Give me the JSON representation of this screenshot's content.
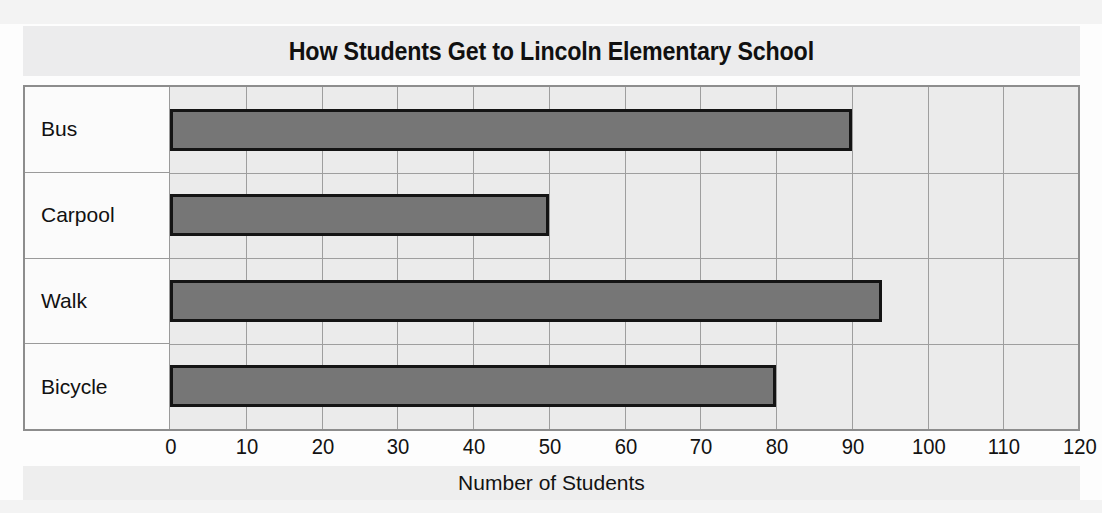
{
  "chart_data": {
    "type": "bar",
    "orientation": "horizontal",
    "title": "How Students Get to Lincoln Elementary School",
    "xlabel": "Number of Students",
    "ylabel": "",
    "categories": [
      "Bus",
      "Carpool",
      "Walk",
      "Bicycle"
    ],
    "values": [
      90,
      50,
      94,
      80
    ],
    "xlim": [
      0,
      120
    ],
    "xticks": [
      0,
      10,
      20,
      30,
      40,
      50,
      60,
      70,
      80,
      90,
      100,
      110,
      120
    ],
    "xtick_labels": [
      "0",
      "10",
      "20",
      "30",
      "40",
      "50",
      "60",
      "70",
      "80",
      "90",
      "100",
      "110",
      "120"
    ],
    "grid": true,
    "legend": false,
    "bar_fill_color": "#767676",
    "bar_border_color": "#141414",
    "plot_background_color": "#ebebeb",
    "gridline_color": "#9e9e9e",
    "frame_color": "#8d8d8d",
    "title_band_color": "#ececed"
  }
}
